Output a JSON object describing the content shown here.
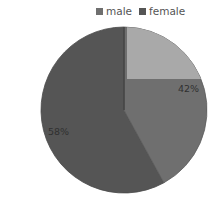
{
  "chart_data": {
    "type": "pie",
    "title": "",
    "legend_position": "top",
    "categories": [
      "male",
      "female"
    ],
    "values": [
      42,
      58
    ],
    "labels": [
      "42%",
      "58%"
    ],
    "colors": [
      "#6f6f6f",
      "#555555"
    ],
    "highlight_color": "#a9a9a9",
    "start_angle_deg": 0,
    "direction": "clockwise"
  },
  "legend": {
    "items": [
      {
        "label": "male",
        "color": "#6f6f6f"
      },
      {
        "label": "female",
        "color": "#555555"
      }
    ]
  },
  "slices": {
    "male": {
      "label": "42%"
    },
    "female": {
      "label": "58%"
    }
  }
}
